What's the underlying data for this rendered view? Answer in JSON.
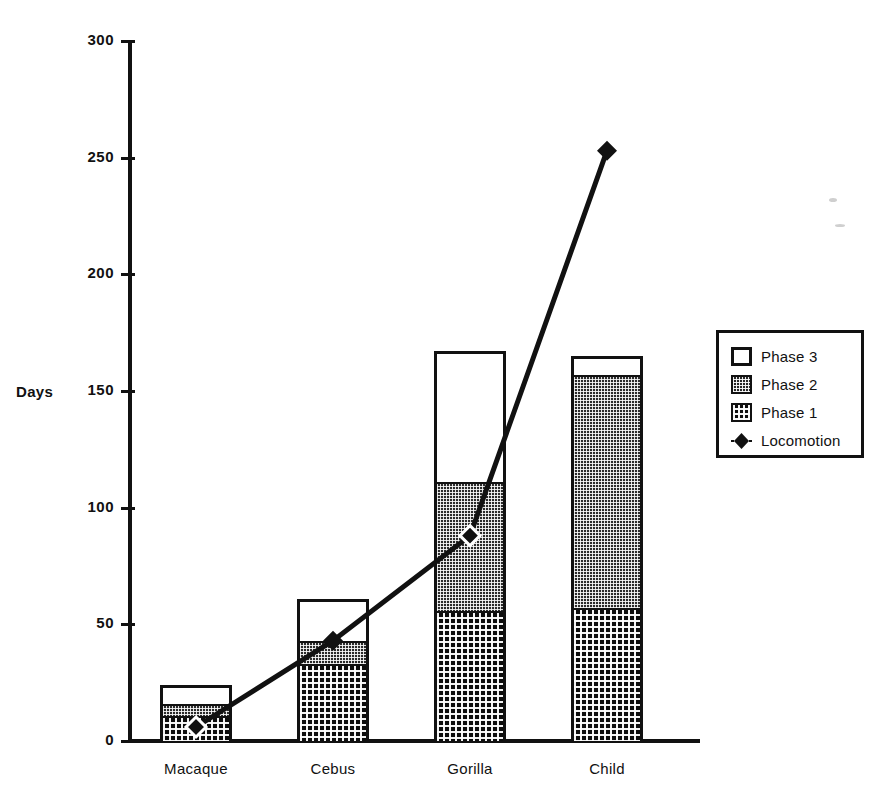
{
  "chart_data": {
    "type": "bar",
    "subtype": "stacked-bar-with-line-overlay",
    "title": "",
    "xlabel": "",
    "ylabel": "Days",
    "ylim": [
      0,
      300
    ],
    "yticks": [
      0,
      50,
      100,
      150,
      200,
      250,
      300
    ],
    "ytick_labels": [
      "0",
      "50",
      "100",
      "150",
      "200",
      "250",
      "300"
    ],
    "grid": false,
    "legend_position": "right",
    "categories": [
      "Macaque",
      "Cebus",
      "Gorilla",
      "Child"
    ],
    "series": [
      {
        "name": "Phase 1",
        "values": [
          10,
          32,
          55,
          56
        ]
      },
      {
        "name": "Phase 2",
        "values": [
          5,
          10,
          55,
          100
        ]
      },
      {
        "name": "Phase 3",
        "values": [
          9,
          19,
          57,
          9
        ]
      },
      {
        "name": "Locomotion",
        "values": [
          6,
          43,
          88,
          253
        ],
        "type": "line"
      }
    ],
    "stacked_totals": [
      24,
      61,
      167,
      165
    ],
    "legend_entries": [
      {
        "label": "Phase 3",
        "marker": "square-open"
      },
      {
        "label": "Phase 2",
        "marker": "square-fine-dot"
      },
      {
        "label": "Phase 1",
        "marker": "square-coarse-dot"
      },
      {
        "label": "Locomotion",
        "marker": "diamond-line"
      }
    ],
    "colors": {
      "phase3": "#ffffff",
      "phase2": "#2b2b2b",
      "phase1": "#0d0d0d",
      "locomotion": "#111111",
      "axis": "#111111"
    }
  },
  "axis": {
    "y_title": "Days",
    "ticks": [
      {
        "value": 300,
        "label": "300"
      },
      {
        "value": 250,
        "label": "250"
      },
      {
        "value": 200,
        "label": "200"
      },
      {
        "value": 150,
        "label": "150"
      },
      {
        "value": 100,
        "label": "100"
      },
      {
        "value": 50,
        "label": "50"
      },
      {
        "value": 0,
        "label": "0"
      }
    ]
  },
  "categories": [
    {
      "label": "Macaque"
    },
    {
      "label": "Cebus"
    },
    {
      "label": "Gorilla"
    },
    {
      "label": "Child"
    }
  ],
  "legend": {
    "items": [
      {
        "label": "Phase 3"
      },
      {
        "label": "Phase 2"
      },
      {
        "label": "Phase 1"
      },
      {
        "label": "Locomotion"
      }
    ]
  }
}
